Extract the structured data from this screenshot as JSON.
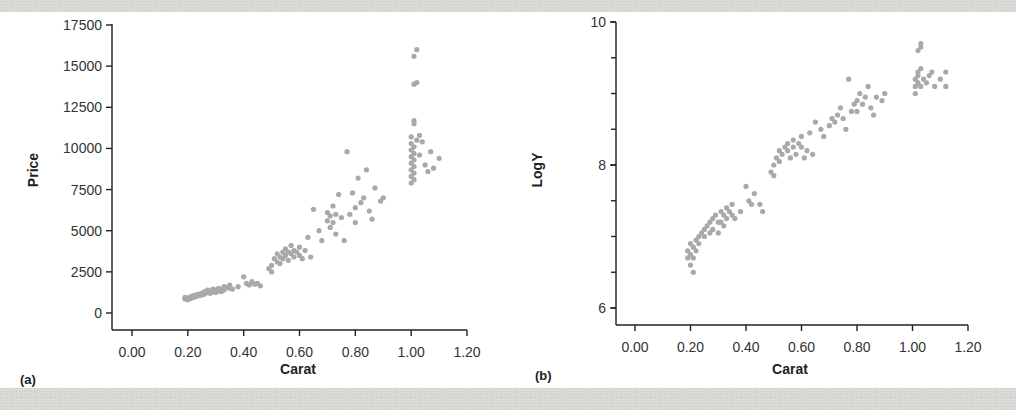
{
  "figure": {
    "panels": [
      {
        "id": "a",
        "label": "(a)"
      },
      {
        "id": "b",
        "label": "(b)"
      }
    ]
  },
  "chart_data": [
    {
      "type": "scatter",
      "panel_label": "(a)",
      "title": "",
      "xlabel": "Carat",
      "ylabel": "Price",
      "xlim": [
        0.0,
        1.2
      ],
      "ylim": [
        0,
        17500
      ],
      "x_ticks": [
        "0.00",
        "0.20",
        "0.40",
        "0.60",
        "0.80",
        "1.00",
        "1.20"
      ],
      "y_ticks": [
        "0",
        "2500",
        "5000",
        "7500",
        "10000",
        "12500",
        "15000",
        "17500"
      ],
      "grid": false,
      "point_color": "#a9a9a9",
      "clusters": [
        {
          "x_range": [
            0.18,
            0.35
          ],
          "y_range": [
            700,
            1800
          ],
          "description": "dense low cluster"
        },
        {
          "x_range": [
            0.35,
            0.46
          ],
          "y_range": [
            1500,
            2300
          ],
          "description": "small cluster"
        },
        {
          "x_range": [
            0.48,
            0.62
          ],
          "y_range": [
            2500,
            4500
          ],
          "description": "mid cluster"
        },
        {
          "x_range": [
            0.62,
            0.92
          ],
          "y_range": [
            4200,
            9800
          ],
          "description": "spread cluster"
        },
        {
          "x_range": [
            1.0,
            1.02
          ],
          "y_range": [
            7800,
            16000
          ],
          "description": "vertical stack at 1.00 carat"
        },
        {
          "x_range": [
            1.02,
            1.1
          ],
          "y_range": [
            8000,
            10500
          ],
          "description": "trailing points"
        }
      ],
      "points": [
        [
          0.19,
          850
        ],
        [
          0.19,
          950
        ],
        [
          0.2,
          800
        ],
        [
          0.2,
          900
        ],
        [
          0.21,
          1000
        ],
        [
          0.21,
          880
        ],
        [
          0.22,
          1050
        ],
        [
          0.22,
          950
        ],
        [
          0.23,
          1100
        ],
        [
          0.23,
          1000
        ],
        [
          0.24,
          1150
        ],
        [
          0.24,
          1050
        ],
        [
          0.25,
          1200
        ],
        [
          0.25,
          1100
        ],
        [
          0.26,
          1300
        ],
        [
          0.26,
          1150
        ],
        [
          0.27,
          1250
        ],
        [
          0.27,
          1400
        ],
        [
          0.28,
          1350
        ],
        [
          0.28,
          1200
        ],
        [
          0.29,
          1450
        ],
        [
          0.29,
          1300
        ],
        [
          0.3,
          1400
        ],
        [
          0.3,
          1250
        ],
        [
          0.31,
          1500
        ],
        [
          0.31,
          1350
        ],
        [
          0.32,
          1450
        ],
        [
          0.32,
          1300
        ],
        [
          0.33,
          1600
        ],
        [
          0.33,
          1400
        ],
        [
          0.34,
          1550
        ],
        [
          0.35,
          1700
        ],
        [
          0.35,
          1500
        ],
        [
          0.36,
          1450
        ],
        [
          0.38,
          1600
        ],
        [
          0.4,
          2200
        ],
        [
          0.41,
          1800
        ],
        [
          0.42,
          1700
        ],
        [
          0.43,
          1900
        ],
        [
          0.44,
          1750
        ],
        [
          0.45,
          1800
        ],
        [
          0.46,
          1650
        ],
        [
          0.49,
          2700
        ],
        [
          0.5,
          2500
        ],
        [
          0.5,
          2900
        ],
        [
          0.51,
          3300
        ],
        [
          0.52,
          3100
        ],
        [
          0.52,
          3600
        ],
        [
          0.53,
          3400
        ],
        [
          0.53,
          3000
        ],
        [
          0.54,
          3700
        ],
        [
          0.54,
          3300
        ],
        [
          0.55,
          3500
        ],
        [
          0.55,
          3900
        ],
        [
          0.56,
          3200
        ],
        [
          0.56,
          3700
        ],
        [
          0.57,
          3600
        ],
        [
          0.57,
          4100
        ],
        [
          0.58,
          3400
        ],
        [
          0.58,
          3800
        ],
        [
          0.59,
          3700
        ],
        [
          0.6,
          4000
        ],
        [
          0.6,
          3500
        ],
        [
          0.61,
          3300
        ],
        [
          0.62,
          3800
        ],
        [
          0.63,
          4600
        ],
        [
          0.64,
          3400
        ],
        [
          0.65,
          6300
        ],
        [
          0.67,
          5000
        ],
        [
          0.68,
          4400
        ],
        [
          0.7,
          5600
        ],
        [
          0.7,
          6100
        ],
        [
          0.71,
          5200
        ],
        [
          0.71,
          5900
        ],
        [
          0.72,
          5500
        ],
        [
          0.72,
          6500
        ],
        [
          0.73,
          6000
        ],
        [
          0.73,
          4800
        ],
        [
          0.74,
          7200
        ],
        [
          0.75,
          5800
        ],
        [
          0.76,
          4400
        ],
        [
          0.77,
          9800
        ],
        [
          0.78,
          6000
        ],
        [
          0.79,
          7300
        ],
        [
          0.8,
          6400
        ],
        [
          0.8,
          5500
        ],
        [
          0.81,
          8200
        ],
        [
          0.82,
          6700
        ],
        [
          0.83,
          7000
        ],
        [
          0.84,
          8700
        ],
        [
          0.85,
          6200
        ],
        [
          0.86,
          5700
        ],
        [
          0.87,
          7600
        ],
        [
          0.89,
          6800
        ],
        [
          0.9,
          7000
        ],
        [
          1.0,
          7900
        ],
        [
          1.0,
          8300
        ],
        [
          1.0,
          8700
        ],
        [
          1.0,
          9100
        ],
        [
          1.0,
          9500
        ],
        [
          1.0,
          9900
        ],
        [
          1.0,
          10300
        ],
        [
          1.0,
          10700
        ],
        [
          1.01,
          8100
        ],
        [
          1.01,
          8500
        ],
        [
          1.01,
          8900
        ],
        [
          1.01,
          9300
        ],
        [
          1.01,
          9700
        ],
        [
          1.01,
          10100
        ],
        [
          1.01,
          11500
        ],
        [
          1.01,
          11700
        ],
        [
          1.01,
          13900
        ],
        [
          1.02,
          14000
        ],
        [
          1.01,
          15600
        ],
        [
          1.02,
          16000
        ],
        [
          1.02,
          10500
        ],
        [
          1.03,
          10800
        ],
        [
          1.03,
          9600
        ],
        [
          1.04,
          10400
        ],
        [
          1.05,
          9000
        ],
        [
          1.06,
          8600
        ],
        [
          1.07,
          9800
        ],
        [
          1.08,
          8800
        ],
        [
          1.1,
          9400
        ]
      ]
    },
    {
      "type": "scatter",
      "panel_label": "(b)",
      "title": "",
      "xlabel": "Carat",
      "ylabel": "LogY",
      "xlim": [
        0.0,
        1.2
      ],
      "ylim": [
        6,
        10
      ],
      "x_ticks": [
        "0.00",
        "0.20",
        "0.40",
        "0.60",
        "0.80",
        "1.00",
        "1.20"
      ],
      "y_ticks": [
        "6",
        "8",
        "10"
      ],
      "y_minor_tick_step": 0.5,
      "grid": false,
      "point_color": "#a9a9a9",
      "points": [
        [
          0.19,
          6.7
        ],
        [
          0.19,
          6.8
        ],
        [
          0.2,
          6.6
        ],
        [
          0.2,
          6.75
        ],
        [
          0.2,
          6.9
        ],
        [
          0.21,
          6.5
        ],
        [
          0.21,
          6.7
        ],
        [
          0.21,
          6.85
        ],
        [
          0.22,
          6.95
        ],
        [
          0.22,
          6.8
        ],
        [
          0.23,
          7.0
        ],
        [
          0.23,
          6.9
        ],
        [
          0.24,
          7.05
        ],
        [
          0.25,
          7.1
        ],
        [
          0.25,
          7.0
        ],
        [
          0.26,
          7.15
        ],
        [
          0.27,
          7.2
        ],
        [
          0.27,
          7.05
        ],
        [
          0.28,
          7.25
        ],
        [
          0.28,
          7.1
        ],
        [
          0.29,
          7.3
        ],
        [
          0.3,
          7.2
        ],
        [
          0.3,
          7.05
        ],
        [
          0.31,
          7.35
        ],
        [
          0.31,
          7.2
        ],
        [
          0.32,
          7.3
        ],
        [
          0.32,
          7.15
        ],
        [
          0.33,
          7.4
        ],
        [
          0.33,
          7.25
        ],
        [
          0.34,
          7.35
        ],
        [
          0.35,
          7.45
        ],
        [
          0.35,
          7.3
        ],
        [
          0.36,
          7.25
        ],
        [
          0.38,
          7.35
        ],
        [
          0.4,
          7.7
        ],
        [
          0.41,
          7.5
        ],
        [
          0.42,
          7.45
        ],
        [
          0.43,
          7.6
        ],
        [
          0.45,
          7.45
        ],
        [
          0.46,
          7.35
        ],
        [
          0.49,
          7.9
        ],
        [
          0.5,
          7.85
        ],
        [
          0.5,
          8.0
        ],
        [
          0.51,
          8.1
        ],
        [
          0.52,
          8.05
        ],
        [
          0.52,
          8.2
        ],
        [
          0.53,
          8.15
        ],
        [
          0.54,
          8.25
        ],
        [
          0.55,
          8.2
        ],
        [
          0.55,
          8.3
        ],
        [
          0.56,
          8.1
        ],
        [
          0.57,
          8.25
        ],
        [
          0.57,
          8.35
        ],
        [
          0.58,
          8.15
        ],
        [
          0.59,
          8.3
        ],
        [
          0.6,
          8.25
        ],
        [
          0.6,
          8.4
        ],
        [
          0.61,
          8.1
        ],
        [
          0.62,
          8.2
        ],
        [
          0.63,
          8.45
        ],
        [
          0.64,
          8.15
        ],
        [
          0.65,
          8.6
        ],
        [
          0.67,
          8.5
        ],
        [
          0.68,
          8.4
        ],
        [
          0.7,
          8.55
        ],
        [
          0.71,
          8.65
        ],
        [
          0.72,
          8.6
        ],
        [
          0.73,
          8.7
        ],
        [
          0.74,
          8.8
        ],
        [
          0.75,
          8.65
        ],
        [
          0.76,
          8.5
        ],
        [
          0.77,
          9.2
        ],
        [
          0.78,
          8.75
        ],
        [
          0.79,
          8.85
        ],
        [
          0.8,
          8.75
        ],
        [
          0.8,
          8.9
        ],
        [
          0.81,
          9.0
        ],
        [
          0.82,
          8.85
        ],
        [
          0.83,
          8.95
        ],
        [
          0.84,
          9.1
        ],
        [
          0.85,
          8.8
        ],
        [
          0.86,
          8.7
        ],
        [
          0.87,
          8.95
        ],
        [
          0.89,
          8.9
        ],
        [
          0.9,
          9.0
        ],
        [
          1.01,
          9.0
        ],
        [
          1.01,
          9.1
        ],
        [
          1.01,
          9.2
        ],
        [
          1.02,
          9.3
        ],
        [
          1.02,
          9.15
        ],
        [
          1.02,
          9.25
        ],
        [
          1.03,
          9.35
        ],
        [
          1.03,
          9.1
        ],
        [
          1.02,
          9.6
        ],
        [
          1.03,
          9.65
        ],
        [
          1.03,
          9.7
        ],
        [
          1.04,
          9.2
        ],
        [
          1.05,
          9.15
        ],
        [
          1.06,
          9.25
        ],
        [
          1.07,
          9.3
        ],
        [
          1.08,
          9.1
        ],
        [
          1.1,
          9.2
        ],
        [
          1.12,
          9.3
        ],
        [
          1.12,
          9.1
        ]
      ]
    }
  ]
}
